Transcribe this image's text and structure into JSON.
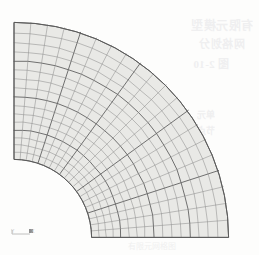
{
  "figure": {
    "kind": "fea-mesh-plot",
    "caption": "有限元网格图",
    "mesh_fill_color": "#e9e9e6",
    "mesh_line_color": "#7c7c7c",
    "mesh_major_line_color": "#5a5a5a",
    "background_color": "#fdfdfc",
    "origin": {
      "x": 14,
      "y": 237
    },
    "inner_radius": 78,
    "outer_radius": 215,
    "start_angle_deg": 0,
    "end_angle_deg": 90,
    "angular_divisions": 20,
    "radial_divisions": 17,
    "major_angular_every": 4,
    "major_radial_every": 4
  },
  "axis_triad": {
    "name": "coordinate-triad",
    "y_label": "Y",
    "x_label": "X"
  },
  "bleed_text": {
    "line1": "有限元模型",
    "line2": "网格划分",
    "line3": "图 2-10",
    "line4": "单元",
    "line5": "节点"
  },
  "chart_data": {
    "type": "mesh",
    "title": "有限元网格图",
    "geometry": "quarter annulus (plate with central circular hole, one quadrant)",
    "inner_radius_px": 78,
    "outer_radius_px": 215,
    "sweep_deg": 90,
    "angular_elements": 20,
    "radial_elements": 17,
    "total_elements": 340,
    "radial_ring_radii_px": [
      78,
      85,
      92,
      99,
      107,
      115,
      123,
      131,
      140,
      149,
      158,
      167,
      176,
      185,
      194,
      204,
      215
    ],
    "angular_ray_degrees": [
      0,
      4.5,
      9,
      13.5,
      18,
      22.5,
      27,
      31.5,
      36,
      40.5,
      45,
      49.5,
      54,
      58.5,
      63,
      67.5,
      72,
      76.5,
      81,
      85.5,
      90
    ],
    "xlabel": "X",
    "ylabel": "Y",
    "grid": true,
    "legend": "none"
  }
}
